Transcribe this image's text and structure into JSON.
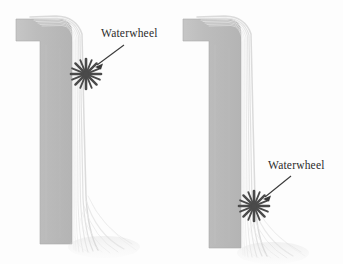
{
  "figure": {
    "name": "waterwheel-placement-comparison",
    "background_color": "#fdfdfd",
    "width": 343,
    "height": 264,
    "panel_count": 2
  },
  "colors": {
    "wall_fill": "#bcbcbc",
    "wall_fill_light": "#c9c9c9",
    "wall_edge": "#a8a8a8",
    "water_stream": "#dcdcdc",
    "water_stream_faint": "#e8e8e8",
    "waterwheel": "#4a4a4a",
    "arrow": "#3a3a3a",
    "label_text": "#2b2b2b",
    "background": "#fdfdfd"
  },
  "panels": [
    {
      "id": "left",
      "name": "panel-waterwheel-high",
      "label": {
        "text": "Waterwheel",
        "x": 101,
        "y": 28
      },
      "waterwheel": {
        "name": "waterwheel-icon",
        "x": 86,
        "y": 74,
        "radius": 15,
        "points": 8,
        "position_description": "near top of fall"
      },
      "arrow": {
        "from_x": 124,
        "from_y": 45,
        "to_x": 95,
        "to_y": 67
      },
      "wall": {
        "top_arm_left": 16,
        "top_arm_top": 19,
        "top_arm_height": 22,
        "vertical_left": 40,
        "vertical_right": 72,
        "bottom": 244,
        "corner_radius": 14
      },
      "water": {
        "crest_x": 72,
        "crest_y": 21,
        "stream_count": 7,
        "splash_bottom": 252
      }
    },
    {
      "id": "right",
      "name": "panel-waterwheel-low",
      "label": {
        "text": "Waterwheel",
        "x": 268,
        "y": 160
      },
      "waterwheel": {
        "name": "waterwheel-icon",
        "x": 83,
        "y": 206,
        "radius": 15,
        "points": 8,
        "position_description": "near bottom of fall"
      },
      "arrow": {
        "from_x": 120,
        "from_y": 176,
        "to_x": 92,
        "to_y": 199
      },
      "wall": {
        "top_arm_left": 12,
        "top_arm_top": 19,
        "top_arm_height": 22,
        "vertical_left": 38,
        "vertical_right": 70,
        "bottom": 248,
        "corner_radius": 14
      },
      "water": {
        "crest_x": 70,
        "crest_y": 21,
        "stream_count": 7,
        "splash_bottom": 256
      }
    }
  ],
  "annotations": {
    "label_text": "Waterwheel",
    "subject": "water falling over a dam wall with waterwheel at differing heights"
  }
}
